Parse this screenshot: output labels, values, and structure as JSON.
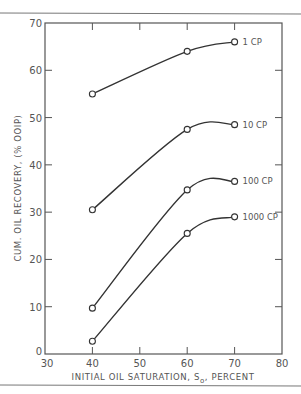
{
  "chart_data": {
    "type": "line",
    "title": "",
    "xlabel": "INITIAL OIL SATURATION, S",
    "xlabel_subscript": "o",
    "xlabel_suffix": ", PERCENT",
    "ylabel": "CUM. OIL RECOVERY, (% OOIP)",
    "xlim": [
      30,
      80
    ],
    "ylim": [
      0,
      70
    ],
    "xticks": [
      30,
      40,
      50,
      60,
      70,
      80
    ],
    "yticks": [
      0,
      10,
      20,
      30,
      40,
      50,
      60,
      70
    ],
    "grid": false,
    "legend": "inline labels at right end of each curve",
    "series": [
      {
        "name": "1 CP",
        "x": [
          40,
          60,
          70
        ],
        "y": [
          55,
          64,
          66
        ]
      },
      {
        "name": "10 CP",
        "x": [
          40,
          60,
          70
        ],
        "y": [
          30.5,
          47.5,
          48.5
        ]
      },
      {
        "name": "100 CP",
        "x": [
          40,
          60,
          70
        ],
        "y": [
          9.7,
          34.7,
          36.5
        ]
      },
      {
        "name": "1000 CP",
        "x": [
          40,
          60,
          70
        ],
        "y": [
          2.7,
          25.5,
          29
        ]
      }
    ]
  }
}
